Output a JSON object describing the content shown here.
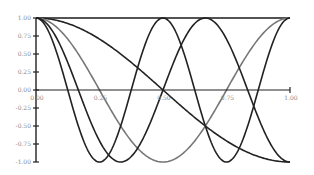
{
  "chart_data": {
    "type": "line",
    "title": "",
    "xlabel": "",
    "ylabel": "",
    "xlim": [
      0,
      1
    ],
    "ylim": [
      -1,
      1
    ],
    "grid": false,
    "legend": null,
    "x_ticks": [
      "0.00",
      "0.25",
      "0.50",
      "0.75",
      "1.00"
    ],
    "y_ticks": [
      "1.00",
      "0.75",
      "0.50",
      "0.25",
      "0.00",
      "-0.25",
      "-0.50",
      "-0.75",
      "-1.00"
    ],
    "series": [
      {
        "name": "cos(0πx)",
        "k": 0,
        "color": "#1a1a1a",
        "x": [
          0,
          0.25,
          0.5,
          0.75,
          1.0
        ],
        "values": [
          1,
          1,
          1,
          1,
          1
        ]
      },
      {
        "name": "cos(1πx)",
        "k": 1,
        "color": "#222222",
        "x": [
          0,
          0.25,
          0.5,
          0.75,
          1.0
        ],
        "values": [
          1,
          0.71,
          0,
          -0.71,
          -1
        ]
      },
      {
        "name": "cos(2πx)",
        "k": 2,
        "color": "#777777",
        "x": [
          0,
          0.25,
          0.5,
          0.75,
          1.0
        ],
        "values": [
          1,
          0,
          -1,
          0,
          1
        ]
      },
      {
        "name": "cos(3πx)",
        "k": 3,
        "color": "#222222",
        "x": [
          0,
          0.1667,
          0.3333,
          0.5,
          0.6667,
          0.8333,
          1.0
        ],
        "values": [
          1,
          0,
          -1,
          0,
          1,
          0,
          -1
        ]
      },
      {
        "name": "cos(4πx)",
        "k": 4,
        "color": "#222222",
        "x": [
          0,
          0.125,
          0.25,
          0.375,
          0.5,
          0.625,
          0.75,
          0.875,
          1.0
        ],
        "values": [
          1,
          0,
          -1,
          0,
          1,
          0,
          -1,
          0,
          1
        ]
      }
    ]
  },
  "layout": {
    "plot_left": 36,
    "plot_right": 290,
    "y_top": 18,
    "y_zero": 90,
    "y_bottom": 162
  }
}
